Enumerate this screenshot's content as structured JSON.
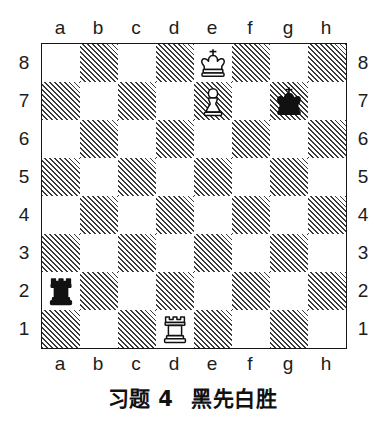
{
  "diagram": {
    "kind": "chess-diagram",
    "caption_exercise": "习题 4",
    "caption_stipulation": "黑先白胜",
    "files": [
      "a",
      "b",
      "c",
      "d",
      "e",
      "f",
      "g",
      "h"
    ],
    "ranks": [
      "8",
      "7",
      "6",
      "5",
      "4",
      "3",
      "2",
      "1"
    ],
    "board": {
      "squares_per_side": 8,
      "orientation": "white-bottom",
      "dark_square_style": "diagonal-hatch",
      "a8_square_color": "light",
      "a1_square_color": "dark",
      "light_color": "#ffffff",
      "dark_hatch_color": "#3a3a3a",
      "border_color": "#151515"
    },
    "pieces": [
      {
        "name": "white-king",
        "color": "white",
        "type": "king",
        "square": "e8",
        "file": 4,
        "rank": 8
      },
      {
        "name": "white-pawn",
        "color": "white",
        "type": "pawn",
        "square": "e7",
        "file": 4,
        "rank": 7
      },
      {
        "name": "black-king",
        "color": "black",
        "type": "king",
        "square": "g7",
        "file": 6,
        "rank": 7
      },
      {
        "name": "black-rook",
        "color": "black",
        "type": "rook",
        "square": "a2",
        "file": 0,
        "rank": 2
      },
      {
        "name": "white-rook",
        "color": "white",
        "type": "rook",
        "square": "d1",
        "file": 3,
        "rank": 1
      }
    ]
  }
}
